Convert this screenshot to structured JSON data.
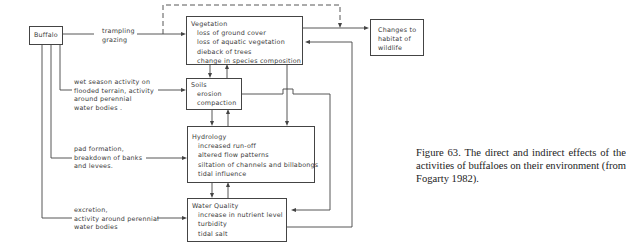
{
  "diagram": {
    "nodes": {
      "buffalo": {
        "title": "Buffalo"
      },
      "vegetation": {
        "title": "Vegetation",
        "items": [
          "loss of ground cover",
          "loss of aquatic vegetation",
          "dieback of trees",
          "change in species composition"
        ]
      },
      "soils": {
        "title": "Soils",
        "items": [
          "erosion",
          "compaction"
        ]
      },
      "hydrology": {
        "title": "Hydrology",
        "items": [
          "increased run-off",
          "altered flow patterns",
          "siltation of channels and billabongs",
          "tidal influence"
        ]
      },
      "water_quality": {
        "title": "Water Quality",
        "items": [
          "increase in nutrient level",
          "turbidity",
          "tidal salt"
        ]
      },
      "changes": {
        "lines": [
          "Changes to",
          "habitat of",
          "wildlife"
        ]
      }
    },
    "edge_labels": {
      "to_vegetation": [
        "trampling",
        "grazing"
      ],
      "to_soils": [
        "wet season activity on",
        "flooded terrain, activity",
        "around perennial",
        "water bodies ."
      ],
      "to_hydrology": [
        "pad formation,",
        "breakdown of banks",
        "and levees."
      ],
      "to_water_quality": [
        "excretion,",
        "activity around perennial",
        "water bodies"
      ]
    }
  },
  "caption": {
    "text": "Figure 63. The direct and indirect effects of the activities of buffaloes on their environment (from Fogarty 1982)."
  }
}
